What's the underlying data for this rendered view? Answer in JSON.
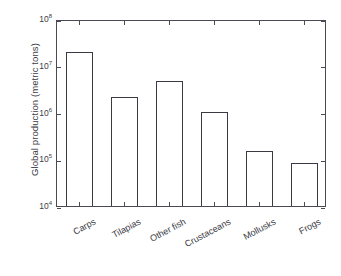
{
  "chart_data": {
    "type": "bar",
    "title": "",
    "xlabel": "",
    "ylabel": "Global production (metric tons)",
    "categories": [
      "Carps",
      "Tilapias",
      "Other fish",
      "Crustaceans",
      "Mollusks",
      "Frogs"
    ],
    "values": [
      20000000,
      2200000,
      4800000,
      1050000,
      150000,
      85000
    ],
    "yscale": "log",
    "ylim": [
      10000,
      100000000
    ],
    "ytick_values": [
      10000,
      100000,
      1000000,
      10000000,
      100000000
    ],
    "ytick_labels": [
      "10⁴",
      "10⁵",
      "10⁶",
      "10⁷",
      "10⁸"
    ],
    "ytick_mantissa": [
      "10",
      "10",
      "10",
      "10",
      "10"
    ],
    "ytick_exponent": [
      "4",
      "5",
      "6",
      "7",
      "8"
    ],
    "grid": false,
    "legend": null,
    "bar_facecolor": "#ffffff",
    "bar_edgecolor": "#3a3a42",
    "axes_color": "#4a4a52",
    "text_color": "#3c3c46"
  },
  "axes": {
    "ylabel": "Global production (metric tons)"
  }
}
